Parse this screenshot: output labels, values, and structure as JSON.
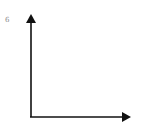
{
  "diagram": {
    "type": "coordinate-axes",
    "y_axis_label": "6",
    "x_axis_label": "",
    "axis_color": "#111111",
    "label_color": "#888888"
  }
}
